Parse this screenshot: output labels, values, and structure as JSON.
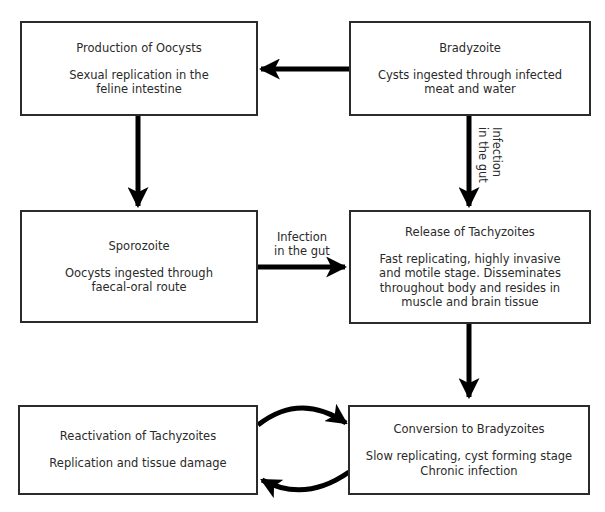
{
  "diagram": {
    "type": "flowchart",
    "nodes": [
      {
        "id": "production_of_oocysts",
        "title": "Production of Oocysts",
        "desc": "Sexual replication in the\nfeline intestine"
      },
      {
        "id": "bradyzoite",
        "title": "Bradyzoite",
        "desc": "Cysts ingested through infected\nmeat and water"
      },
      {
        "id": "sporozoite",
        "title": "Sporozoite",
        "desc": "Oocysts ingested through\nfaecal-oral route"
      },
      {
        "id": "release_of_tachyzoites",
        "title": "Release of Tachyzoites",
        "desc": "Fast replicating, highly invasive\nand motile stage. Disseminates\nthroughout body and resides in\nmuscle and brain tissue"
      },
      {
        "id": "reactivation_of_tachyzoites",
        "title": "Reactivation of Tachyzoites",
        "desc": "Replication and tissue damage"
      },
      {
        "id": "conversion_to_bradyzoites",
        "title": "Conversion to Bradyzoites",
        "desc": "Slow replicating, cyst forming stage\nChronic infection"
      }
    ],
    "edges": [
      {
        "from": "bradyzoite",
        "to": "production_of_oocysts",
        "label": ""
      },
      {
        "from": "production_of_oocysts",
        "to": "sporozoite",
        "label": ""
      },
      {
        "from": "bradyzoite",
        "to": "release_of_tachyzoites",
        "label": "Infection\nin the gut"
      },
      {
        "from": "sporozoite",
        "to": "release_of_tachyzoites",
        "label": "Infection\nin the gut"
      },
      {
        "from": "release_of_tachyzoites",
        "to": "conversion_to_bradyzoites",
        "label": ""
      },
      {
        "from": "reactivation_of_tachyzoites",
        "to": "conversion_to_bradyzoites",
        "label": ""
      },
      {
        "from": "conversion_to_bradyzoites",
        "to": "reactivation_of_tachyzoites",
        "label": ""
      }
    ]
  },
  "colors": {
    "line": "#000000",
    "border": "#2b2b2b",
    "text": "#2a2a2a",
    "background": "#ffffff"
  }
}
